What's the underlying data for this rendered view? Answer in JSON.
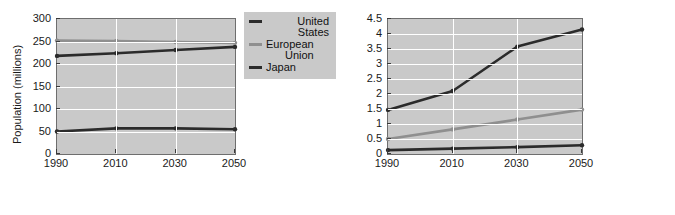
{
  "colors": {
    "plot_background": "#c9c9c9",
    "grid": "#ffffff",
    "axis": "#6e6e6e",
    "legend_background": "#c9c9c9",
    "dark_series": "#2b2b2b",
    "mid_series": "#555555",
    "light_series": "#8f8f8f",
    "text": "#111111",
    "page_background": "#ffffff"
  },
  "chart_data": [
    {
      "id": "developed-economies-population",
      "type": "line",
      "title": "",
      "xlabel": "",
      "ylabel": "Population (millions)",
      "categories": [
        "1990",
        "2010",
        "2030",
        "2050"
      ],
      "x": [
        1990,
        2010,
        2030,
        2050
      ],
      "xlim": [
        1990,
        2050
      ],
      "ylim": [
        0,
        300
      ],
      "yticks": [
        "0",
        "50",
        "100",
        "150",
        "200",
        "250",
        "300"
      ],
      "ytick_values": [
        0,
        50,
        100,
        150,
        200,
        250,
        300
      ],
      "xticks": [
        "1990",
        "2010",
        "2030",
        "2050"
      ],
      "grid": true,
      "legend_position": "outside-top-right",
      "markers": true,
      "series": [
        {
          "name": "United States",
          "color": "#2b2b2b",
          "values": [
            218,
            224,
            231,
            238
          ]
        },
        {
          "name": "European\nUnion",
          "legend_label": "European Union",
          "color": "#8f8f8f",
          "values": [
            252,
            251,
            249,
            247
          ]
        },
        {
          "name": "Japan",
          "color": "#2b2b2b",
          "values": [
            50,
            57,
            57,
            55
          ]
        }
      ]
    },
    {
      "id": "emerging-economies-population",
      "type": "line",
      "title": "",
      "xlabel": "",
      "ylabel": "Population (billions)",
      "categories": [
        "1990",
        "2010",
        "2030",
        "2050"
      ],
      "x": [
        1990,
        2010,
        2030,
        2050
      ],
      "xlim": [
        1990,
        2050
      ],
      "ylim": [
        0,
        4.5
      ],
      "yticks": [
        "0",
        "0.5",
        "1",
        "1.5",
        "2",
        "2.5",
        "3",
        "3.5",
        "4",
        "4.5"
      ],
      "ytick_values": [
        0,
        0.5,
        1,
        1.5,
        2,
        2.5,
        3,
        3.5,
        4,
        4.5
      ],
      "xticks": [
        "1990",
        "2010",
        "2030",
        "2050"
      ],
      "grid": true,
      "legend_position": "outside-top-right",
      "markers": true,
      "series": [
        {
          "name": "China",
          "color": "#2b2b2b",
          "values": [
            1.47,
            2.1,
            3.58,
            4.15
          ]
        },
        {
          "name": "India",
          "color": "#8f8f8f",
          "values": [
            0.5,
            0.82,
            1.15,
            1.48
          ]
        },
        {
          "name": "Nigeria",
          "color": "#2b2b2b",
          "values": [
            0.13,
            0.18,
            0.23,
            0.29
          ]
        }
      ]
    }
  ]
}
